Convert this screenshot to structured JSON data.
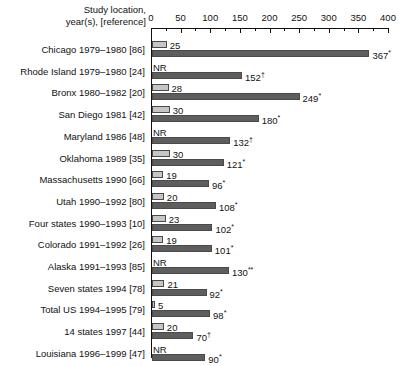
{
  "header": {
    "line1": "Study location,",
    "line2": "year(s), [reference]"
  },
  "axis": {
    "ticks": [
      0,
      50,
      100,
      150,
      200,
      250,
      300,
      350,
      400
    ],
    "minor_ticks": [
      25,
      75,
      125,
      175,
      225,
      275,
      325,
      375
    ],
    "min": 0,
    "max": 400
  },
  "legend_markers": {
    "nr": "NR",
    "asterisk": "*",
    "double_asterisk": "**",
    "dagger": "†"
  },
  "colors": {
    "light_bar": "#c6c6c6",
    "dark_bar": "#5e5e5e",
    "axis": "#111111",
    "background": "#ffffff"
  },
  "chart_data": {
    "type": "bar",
    "title": "",
    "xlabel": "",
    "ylabel": "Study location, year(s), [reference]",
    "xlim": [
      0,
      400
    ],
    "grid": false,
    "orientation": "horizontal",
    "legend": [],
    "categories": [
      "Chicago 1979–1980 [86]",
      "Rhode Island 1979–1980 [24]",
      "Bronx 1980–1982 [20]",
      "San Diego 1981 [42]",
      "Maryland 1986 [48]",
      "Oklahoma 1989 [35]",
      "Massachusetts 1990 [66]",
      "Utah 1990–1992 [80]",
      "Four states 1990–1993 [10]",
      "Colorado 1991–1992 [26]",
      "Alaska 1991–1993 [85]",
      "Seven states 1994 [78]",
      "Total US 1994–1995 [79]",
      "14 states 1997 [44]",
      "Louisiana 1996–1999 [47]"
    ],
    "series": [
      {
        "name": "light",
        "values": [
          25,
          null,
          28,
          30,
          null,
          30,
          19,
          20,
          23,
          19,
          null,
          21,
          5,
          20,
          null
        ],
        "labels": [
          "25",
          "NR",
          "28",
          "30",
          "NR",
          "30",
          "19",
          "20",
          "23",
          "19",
          "NR",
          "21",
          "5",
          "20",
          "NR"
        ]
      },
      {
        "name": "dark",
        "values": [
          367,
          152,
          249,
          180,
          132,
          121,
          96,
          108,
          102,
          101,
          130,
          92,
          98,
          70,
          90
        ],
        "labels": [
          "367*",
          "152†",
          "249*",
          "180*",
          "132†",
          "121*",
          "96*",
          "108*",
          "102*",
          "101*",
          "130**",
          "92*",
          "98*",
          "70†",
          "90*"
        ]
      }
    ],
    "rows": [
      {
        "label": "Chicago 1979–1980 [86]",
        "light": 25,
        "light_label": "25",
        "light_nr": false,
        "dark": 367,
        "dark_num": "367",
        "dark_mark": "*"
      },
      {
        "label": "Rhode Island 1979–1980 [24]",
        "light": null,
        "light_label": "NR",
        "light_nr": true,
        "dark": 152,
        "dark_num": "152",
        "dark_mark": "†"
      },
      {
        "label": "Bronx 1980–1982 [20]",
        "light": 28,
        "light_label": "28",
        "light_nr": false,
        "dark": 249,
        "dark_num": "249",
        "dark_mark": "*"
      },
      {
        "label": "San Diego 1981 [42]",
        "light": 30,
        "light_label": "30",
        "light_nr": false,
        "dark": 180,
        "dark_num": "180",
        "dark_mark": "*"
      },
      {
        "label": "Maryland 1986 [48]",
        "light": null,
        "light_label": "NR",
        "light_nr": true,
        "dark": 132,
        "dark_num": "132",
        "dark_mark": "†"
      },
      {
        "label": "Oklahoma 1989 [35]",
        "light": 30,
        "light_label": "30",
        "light_nr": false,
        "dark": 121,
        "dark_num": "121",
        "dark_mark": "*"
      },
      {
        "label": "Massachusetts 1990 [66]",
        "light": 19,
        "light_label": "19",
        "light_nr": false,
        "dark": 96,
        "dark_num": "96",
        "dark_mark": "*"
      },
      {
        "label": "Utah 1990–1992 [80]",
        "light": 20,
        "light_label": "20",
        "light_nr": false,
        "dark": 108,
        "dark_num": "108",
        "dark_mark": "*"
      },
      {
        "label": "Four states 1990–1993 [10]",
        "light": 23,
        "light_label": "23",
        "light_nr": false,
        "dark": 102,
        "dark_num": "102",
        "dark_mark": "*"
      },
      {
        "label": "Colorado 1991–1992 [26]",
        "light": 19,
        "light_label": "19",
        "light_nr": false,
        "dark": 101,
        "dark_num": "101",
        "dark_mark": "*"
      },
      {
        "label": "Alaska 1991–1993 [85]",
        "light": null,
        "light_label": "NR",
        "light_nr": true,
        "dark": 130,
        "dark_num": "130",
        "dark_mark": "**"
      },
      {
        "label": "Seven states 1994 [78]",
        "light": 21,
        "light_label": "21",
        "light_nr": false,
        "dark": 92,
        "dark_num": "92",
        "dark_mark": "*"
      },
      {
        "label": "Total US 1994–1995 [79]",
        "light": 5,
        "light_label": "5",
        "light_nr": false,
        "dark": 98,
        "dark_num": "98",
        "dark_mark": "*"
      },
      {
        "label": "14 states 1997 [44]",
        "light": 20,
        "light_label": "20",
        "light_nr": false,
        "dark": 70,
        "dark_num": "70",
        "dark_mark": "†"
      },
      {
        "label": "Louisiana 1996–1999 [47]",
        "light": null,
        "light_label": "NR",
        "light_nr": true,
        "dark": 90,
        "dark_num": "90",
        "dark_mark": "*"
      }
    ]
  }
}
